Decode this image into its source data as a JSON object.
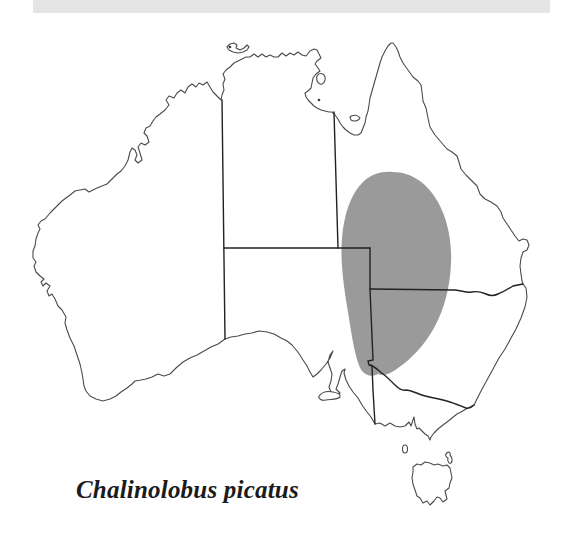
{
  "page": {
    "background": "#ffffff"
  },
  "top_bar": {
    "color": "#e5e5e5"
  },
  "map": {
    "label": "australia-species-distribution-map",
    "colors": {
      "land": "#ffffff",
      "coastline": "#4a4a4a",
      "border": "#222222",
      "range_fill": "#9a9a9a",
      "island_dot": "#3a3a3a",
      "caption_text": "#1b1b1b"
    },
    "features": [
      "mainland-australia-coastline",
      "state-borders",
      "distribution-range",
      "tasmania",
      "kangaroo-island",
      "king-island",
      "flinders-island",
      "melville-island",
      "groote-eylandt",
      "mornington-island"
    ]
  },
  "caption": {
    "species_label": "Chalinolobus picatus"
  }
}
